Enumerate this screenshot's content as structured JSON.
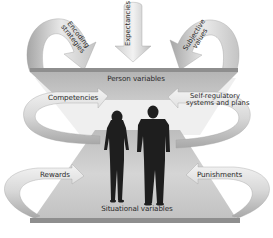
{
  "figure": {
    "top_slab_label": "Person variables",
    "bottom_slab_label": "Situational variables",
    "arrows": {
      "encoding_strategies": {
        "line1": "Encoding",
        "line2": "strategies"
      },
      "expectancies": "Expectancies",
      "subjective_values": {
        "line1": "Subjective",
        "line2": "values"
      },
      "competencies": "Competencies",
      "self_regulatory": {
        "line1": "Self-regulatory",
        "line2": "systems and plans"
      },
      "rewards": "Rewards",
      "punishments": "Punishments"
    },
    "people": [
      "woman-silhouette",
      "man-silhouette"
    ],
    "colors": {
      "slab": "#b9b9b9",
      "slab_edge": "#8e8e8e",
      "arrow_light": "#e6e6e6",
      "arrow_dark": "#9a9a9a",
      "silhouette": "#1e1e1e",
      "background": "#ffffff"
    }
  }
}
